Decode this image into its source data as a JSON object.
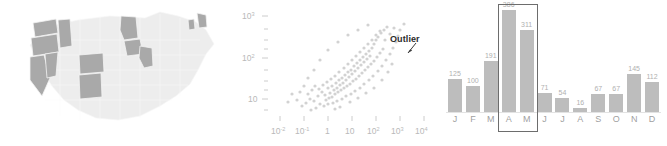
{
  "figure": {
    "panels": [
      "choropleth-map",
      "scatter-plot",
      "bar-chart"
    ]
  },
  "map": {
    "title": "",
    "highlight_color": "#a9a9a9",
    "base_color": "#ededed",
    "highlighted_states": [
      "WA",
      "OR",
      "ID",
      "CA",
      "NV",
      "CO",
      "NM",
      "MN",
      "WI",
      "IL",
      "ME",
      "VT"
    ]
  },
  "chart_data": [
    {
      "type": "scatter",
      "title": "",
      "xlabel": "",
      "ylabel": "",
      "xscale": "log",
      "yscale": "log",
      "xticklabels": [
        "10-2",
        "10-1",
        "1",
        "10",
        "102",
        "103",
        "104"
      ],
      "xtick_base": [
        "10",
        "10",
        "1",
        "10",
        "10",
        "10",
        "10"
      ],
      "xtick_exp": [
        "-2",
        "-1",
        "",
        "",
        "2",
        "3",
        "4"
      ],
      "yticklabels": [
        "103",
        "102",
        "10"
      ],
      "ytick_base": [
        "10",
        "10",
        "10"
      ],
      "ytick_exp": [
        "3",
        "2",
        ""
      ],
      "xlim": [
        0.01,
        10000
      ],
      "ylim": [
        5,
        1000
      ],
      "grid": false,
      "point_color": "#d2d2d2",
      "annotations": [
        {
          "text": "Outlier",
          "arrow": "down-left"
        }
      ],
      "correlation": "positive",
      "n_points": 260
    },
    {
      "type": "bar",
      "title": "",
      "xlabel": "",
      "ylabel": "",
      "categories": [
        "J",
        "F",
        "M",
        "A",
        "M",
        "J",
        "J",
        "A",
        "S",
        "O",
        "N",
        "D"
      ],
      "values": [
        125,
        100,
        191,
        386,
        311,
        71,
        54,
        16,
        67,
        67,
        145,
        112
      ],
      "ylim": [
        0,
        400
      ],
      "grid": false,
      "bar_color": "#bdbdbd",
      "highlight": {
        "from_category": "A",
        "to_category": "M",
        "border_color": "#6d6d6d"
      }
    }
  ]
}
